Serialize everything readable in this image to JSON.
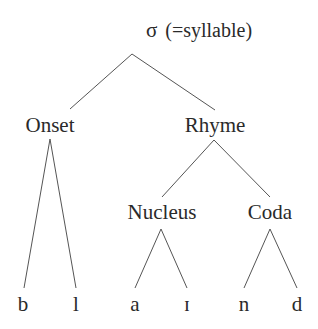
{
  "diagram": {
    "type": "syllable-tree",
    "root": {
      "symbol": "σ",
      "gloss": "(=syllable)"
    },
    "nodes": {
      "onset": "Onset",
      "rhyme": "Rhyme",
      "nucleus": "Nucleus",
      "coda": "Coda"
    },
    "leaves": [
      "b",
      "l",
      "a",
      "ɪ",
      "n",
      "d"
    ],
    "edges": [
      [
        "σ",
        "Onset"
      ],
      [
        "σ",
        "Rhyme"
      ],
      [
        "Onset",
        "b"
      ],
      [
        "Onset",
        "l"
      ],
      [
        "Rhyme",
        "Nucleus"
      ],
      [
        "Rhyme",
        "Coda"
      ],
      [
        "Nucleus",
        "a"
      ],
      [
        "Nucleus",
        "ɪ"
      ],
      [
        "Coda",
        "n"
      ],
      [
        "Coda",
        "d"
      ]
    ],
    "line_color": "#555555"
  }
}
